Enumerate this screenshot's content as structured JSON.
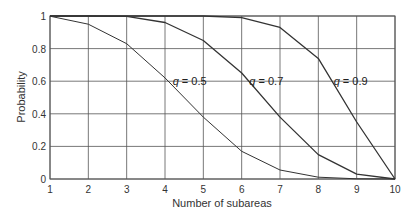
{
  "chart_data": {
    "type": "line",
    "title": "",
    "xlabel": "Number of subareas",
    "ylabel": "Probability",
    "x": [
      1,
      2,
      3,
      4,
      5,
      6,
      7,
      8,
      9,
      10
    ],
    "xlim": [
      1,
      10
    ],
    "ylim": [
      0,
      1
    ],
    "xticks": [
      "1",
      "2",
      "3",
      "4",
      "5",
      "6",
      "7",
      "8",
      "9",
      "10"
    ],
    "yticks": [
      "0",
      "0.2",
      "0.4",
      "0.6",
      "0.8",
      "1"
    ],
    "grid": true,
    "legend": "none (inline annotations)",
    "series": [
      {
        "name": "q = 0.5",
        "values": [
          0.999,
          0.95,
          0.83,
          0.62,
          0.38,
          0.17,
          0.055,
          0.011,
          0.001,
          0.0
        ]
      },
      {
        "name": "q = 0.7",
        "values": [
          1.0,
          1.0,
          0.998,
          0.96,
          0.85,
          0.65,
          0.38,
          0.15,
          0.03,
          0.0
        ]
      },
      {
        "name": "q = 0.9",
        "values": [
          1.0,
          1.0,
          1.0,
          1.0,
          1.0,
          0.99,
          0.93,
          0.74,
          0.35,
          0.0
        ]
      }
    ],
    "annotations": [
      {
        "text_italic": "q",
        "text_rest": " = 0.5",
        "x": 4.2,
        "y": 0.6
      },
      {
        "text_italic": "q",
        "text_rest": " = 0.7",
        "x": 6.2,
        "y": 0.6
      },
      {
        "text_italic": "q",
        "text_rest": " = 0.9",
        "x": 8.4,
        "y": 0.6
      }
    ],
    "colors": {
      "line": "#333333",
      "grid": "#555555",
      "text": "#333333"
    }
  }
}
